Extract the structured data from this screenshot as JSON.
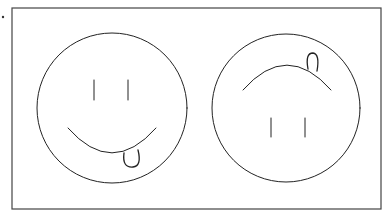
{
  "figure": {
    "bullet_dot": {
      "cx": 3,
      "cy": 17,
      "r": 1.2
    },
    "frame": {
      "x": 12,
      "y": 8,
      "width": 369,
      "height": 201,
      "stroke": "#444444"
    },
    "stroke_color": "#222222",
    "faces": [
      {
        "name": "upright-smiley",
        "orientation": "upright",
        "circle": {
          "cx": 112,
          "cy": 108,
          "r": 75
        },
        "eyes": [
          {
            "x": 94,
            "y1": 80,
            "y2": 100
          },
          {
            "x": 128,
            "y1": 80,
            "y2": 100
          }
        ],
        "mouth": {
          "path": "M68,128 Q112,178 156,128"
        },
        "tongue": {
          "path": "M124,153 Q122,168 133,167 Q142,166 138,150"
        }
      },
      {
        "name": "inverted-smiley",
        "orientation": "upside-down",
        "circle": {
          "cx": 286,
          "cy": 108,
          "r": 74
        },
        "eyes": [
          {
            "x": 271,
            "y1": 118,
            "y2": 137
          },
          {
            "x": 305,
            "y1": 118,
            "y2": 137
          }
        ],
        "mouth": {
          "path": "M243,90 Q287,40 331,90"
        },
        "tongue": {
          "path": "M308,69 Q305,53 313,53 Q320,54 317,71"
        }
      }
    ]
  }
}
